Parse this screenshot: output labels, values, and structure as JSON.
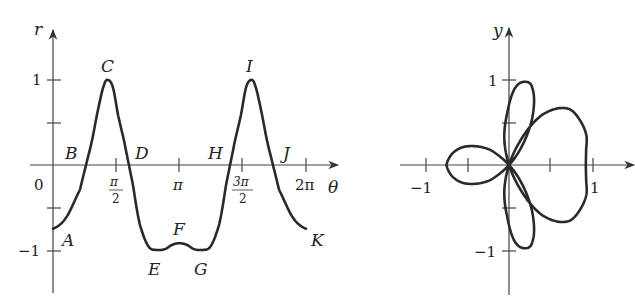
{
  "chart_data": [
    {
      "type": "line",
      "title": "",
      "xlabel": "θ",
      "ylabel": "r",
      "x_tick_labels": [
        "0",
        "π/2",
        "π",
        "3π/2",
        "2π"
      ],
      "y_tick_labels": [
        "1",
        "−1"
      ],
      "xlim": [
        0,
        6.2832
      ],
      "ylim": [
        -1,
        1
      ],
      "grid": false,
      "series": [
        {
          "name": "r(θ)",
          "theta": [
            0,
            0.323,
            0.671,
            0.82,
            0.969,
            1.118,
            1.267,
            1.366,
            1.49,
            1.614,
            1.763,
            1.887,
            1.987,
            2.086,
            2.161,
            2.285,
            2.409,
            2.583,
            2.782,
            2.955,
            3.1416
          ],
          "r": [
            -0.75,
            -0.62,
            -0.29,
            0,
            0.29,
            0.65,
            0.94,
            1.0,
            0.91,
            0.59,
            0.29,
            0,
            -0.24,
            -0.53,
            -0.71,
            -0.88,
            -0.98,
            -1.0,
            -0.99,
            -0.94,
            -0.92
          ],
          "symmetric_about": "π"
        }
      ],
      "annotations": [
        {
          "label": "A",
          "theta": 0,
          "r": -0.75
        },
        {
          "label": "B",
          "theta": 0.82,
          "r": 0
        },
        {
          "label": "C",
          "theta": 1.366,
          "r": 1.0
        },
        {
          "label": "D",
          "theta": 1.887,
          "r": 0
        },
        {
          "label": "E",
          "theta": 2.583,
          "r": -1.0
        },
        {
          "label": "F",
          "theta": 3.1416,
          "r": -0.92
        },
        {
          "label": "G",
          "theta": 3.7,
          "r": -1.0
        },
        {
          "label": "H",
          "theta": 4.396,
          "r": 0
        },
        {
          "label": "I",
          "theta": 4.917,
          "r": 1.0
        },
        {
          "label": "J",
          "theta": 5.463,
          "r": 0
        },
        {
          "label": "K",
          "theta": 6.2832,
          "r": -0.75
        }
      ]
    },
    {
      "type": "line",
      "title": "",
      "subtype": "polar-curve",
      "xlabel": "x",
      "ylabel": "y",
      "x_tick_labels": [
        "−1",
        "1"
      ],
      "y_tick_labels": [
        "1",
        "−1"
      ],
      "xlim": [
        -1,
        1
      ],
      "ylim": [
        -1,
        1
      ],
      "grid": false,
      "description": "Polar plot of the same r(θ), θ from 0 to 2π: small left loop, top and bottom petals, large right lobe"
    }
  ],
  "left": {
    "r_label": "r",
    "theta_label": "θ",
    "origin_label": "0",
    "y_ticks": {
      "one": "1",
      "minus_one": "−1"
    },
    "x_ticks": {
      "pi_half_num": "π",
      "pi_half_den": "2",
      "pi": "π",
      "three_pi_half_num": "3π",
      "three_pi_half_den": "2",
      "two_pi": "2π"
    },
    "points": {
      "A": "A",
      "B": "B",
      "C": "C",
      "D": "D",
      "E": "E",
      "F": "F",
      "G": "G",
      "H": "H",
      "I": "I",
      "J": "J",
      "K": "K"
    }
  },
  "right": {
    "y_label": "y",
    "x_ticks": {
      "minus_one": "−1",
      "one": "1"
    },
    "y_ticks": {
      "one": "1",
      "minus_one": "−1"
    }
  }
}
